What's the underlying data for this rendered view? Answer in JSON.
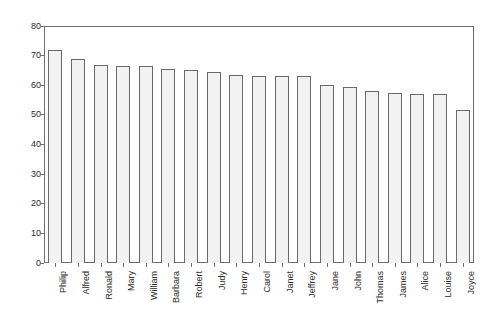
{
  "chart_data": {
    "type": "bar",
    "title": "",
    "subtitle": "",
    "xlabel": "",
    "ylabel": "",
    "categories": [
      "Philip",
      "Alfred",
      "Ronald",
      "Mary",
      "William",
      "Barbara",
      "Robert",
      "Judy",
      "Henry",
      "Carol",
      "Janet",
      "Jeffrey",
      "Jane",
      "John",
      "Thomas",
      "James",
      "Alice",
      "Louise",
      "Joyce"
    ],
    "values": [
      72,
      69,
      67,
      66.5,
      66.5,
      65.5,
      65,
      64.5,
      63.5,
      63,
      63,
      63,
      60,
      59.5,
      58,
      57.5,
      57,
      57,
      51.5
    ],
    "ylim": [
      0,
      80
    ],
    "ytick_labels": [
      "0",
      "10",
      "20",
      "30",
      "40",
      "50",
      "60",
      "70",
      "80"
    ],
    "ytick_values": [
      0,
      10,
      20,
      30,
      40,
      50,
      60,
      70,
      80
    ],
    "grid": false,
    "legend": false,
    "legend_position": "none",
    "bar_fill_color": "#f2f2f2",
    "bar_edge_color": "#6a6a6a",
    "axis_color": "#6f6f6f",
    "text_color": "#2b2b2b",
    "background_color": "#ffffff"
  }
}
